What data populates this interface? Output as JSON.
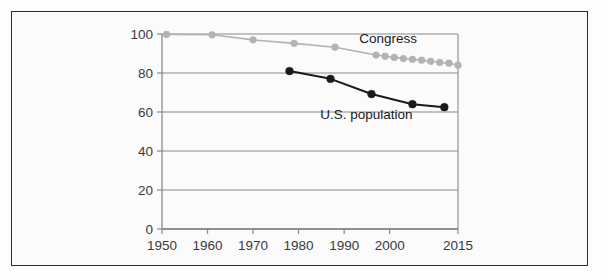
{
  "figure": {
    "background_color": "#fdfdfd",
    "frame_border_color": "#2b2b2b"
  },
  "chart_data": {
    "type": "line",
    "title": "",
    "subtitle": "",
    "xlabel": "",
    "ylabel": "",
    "xlim": [
      1950,
      2015
    ],
    "ylim": [
      0,
      100
    ],
    "grid": true,
    "grid_orientation": "horizontal",
    "legend_position": "inline-annotations",
    "xticks": [
      1950,
      1960,
      1970,
      1980,
      1990,
      2000,
      2015
    ],
    "xtick_labels": [
      "1950",
      "1960",
      "1970",
      "1980",
      "1990",
      "2000",
      "2015"
    ],
    "yticks": [
      0,
      20,
      40,
      60,
      80,
      100
    ],
    "ytick_labels": [
      "0",
      "20",
      "40",
      "60",
      "80",
      "100"
    ],
    "series": [
      {
        "name": "Congress",
        "color": "#b3b3b3",
        "marker": "circle",
        "label_text": "Congress",
        "x": [
          1951,
          1961,
          1970,
          1979,
          1988,
          1997,
          1999,
          2001,
          2003,
          2005,
          2007,
          2009,
          2011,
          2013,
          2015
        ],
        "values": [
          99.8,
          99.6,
          97.0,
          95.2,
          93.2,
          89.2,
          88.6,
          88.0,
          87.4,
          87.0,
          86.6,
          86.0,
          85.4,
          85.0,
          84.0
        ]
      },
      {
        "name": "U.S. population",
        "color": "#1a1a1a",
        "marker": "circle",
        "label_text": "U.S. population",
        "x": [
          1978,
          1987,
          1996,
          2005,
          2012
        ],
        "values": [
          81.0,
          77.0,
          69.2,
          64.0,
          62.5
        ]
      }
    ],
    "annotations": [
      {
        "text": "Congress",
        "x": 2006,
        "y": 95.5,
        "color": "#1a1a1a"
      },
      {
        "text": "U.S. population",
        "x": 2005,
        "y": 56.5,
        "color": "#1a1a1a"
      }
    ],
    "axis_color": "#8a8a8a",
    "gridline_color": "#8a8a8a",
    "tick_label_color": "#3a3a3a"
  }
}
